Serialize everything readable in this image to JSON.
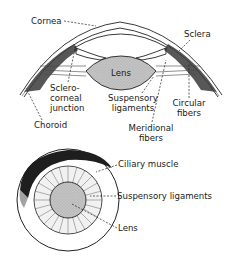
{
  "diagram": {
    "top_view": {
      "title": "Cross-section of anterior eye",
      "labels": {
        "cornea": "Cornea",
        "sclera": "Sclera",
        "lens": "Lens",
        "sclerocorneal_1": "Sclero-",
        "sclerocorneal_2": "corneal",
        "sclerocorneal_3": "junction",
        "suspensory_1": "Suspensory",
        "suspensory_2": "ligaments",
        "circular_1": "Circular",
        "circular_2": "fibers",
        "choroid": "Choroid",
        "meridional_1": "Meridional",
        "meridional_2": "fibers"
      }
    },
    "bottom_view": {
      "title": "Frontal view of lens and ciliary body",
      "labels": {
        "ciliary_muscle": "Ciliary muscle",
        "suspensory_ligaments": "Suspensory ligaments",
        "lens": "Lens"
      }
    },
    "colors": {
      "ink": "#222222",
      "lens_fill": "#bdbdbd",
      "muscle_dark": "#2a2a2a",
      "background": "#ffffff"
    }
  }
}
